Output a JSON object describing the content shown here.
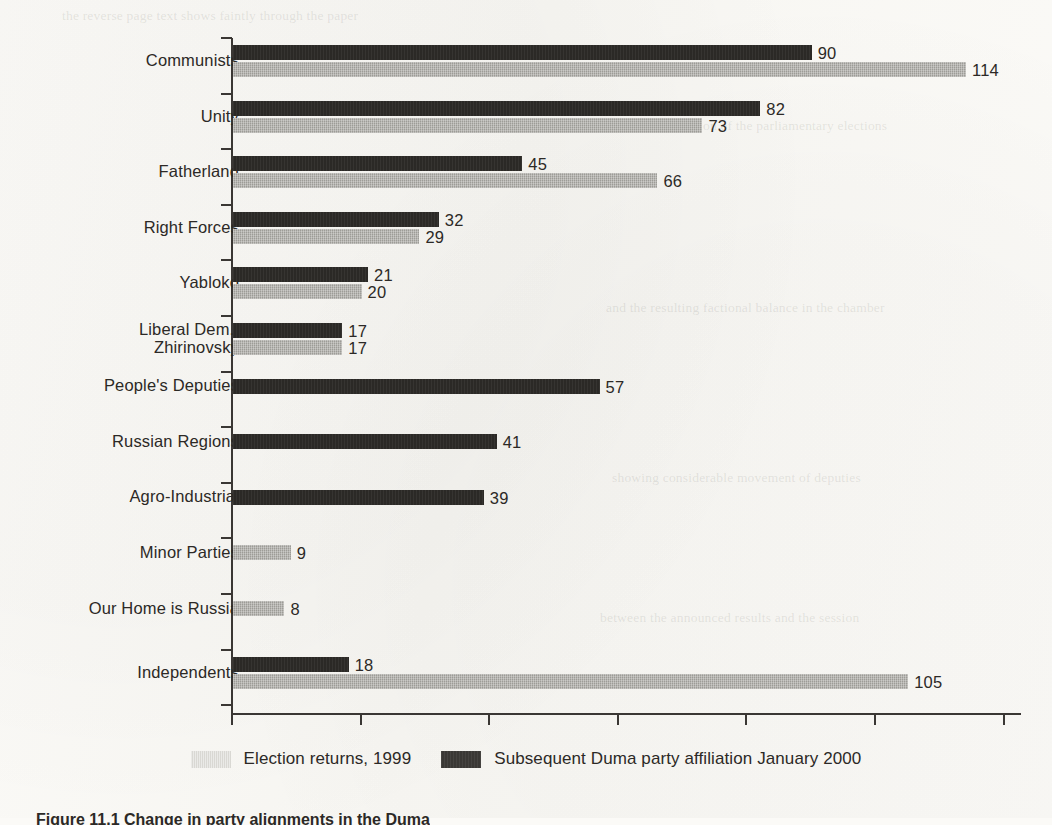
{
  "chart_data": {
    "type": "bar",
    "orientation": "horizontal",
    "title": "",
    "xlabel": "",
    "ylabel": "",
    "xlim": [
      0,
      123
    ],
    "grid": false,
    "axis_ticks_labeled": false,
    "x_tick_count": 7,
    "legend_position": "bottom-center",
    "categories": [
      "Communists",
      "Unity",
      "Fatherland",
      "Right Forces",
      "Yabloko",
      "Liberal Dem./\nZhirinovsky",
      "People's Deputies",
      "Russian Regions",
      "Agro-Industrial",
      "Minor Parties",
      "Our Home is Russia",
      "Independents"
    ],
    "series": [
      {
        "name": "Subsequent Duma party affiliation January 2000",
        "color": "#2b2926",
        "values": [
          90,
          82,
          45,
          32,
          21,
          17,
          57,
          41,
          39,
          null,
          null,
          18
        ]
      },
      {
        "name": "Election returns, 1999",
        "color": "#9d9c97",
        "values": [
          114,
          73,
          66,
          29,
          20,
          17,
          null,
          null,
          null,
          9,
          8,
          105
        ]
      }
    ]
  },
  "legend": {
    "items": [
      {
        "label": "Election returns, 1999",
        "swatch": "light"
      },
      {
        "label": "Subsequent Duma party affiliation January 2000",
        "swatch": "dark"
      }
    ]
  },
  "caption": {
    "text": "Figure 11.1 Change in party alignments in the Duma"
  },
  "colors": {
    "dark_bar": "#2b2926",
    "light_bar": "#9d9c97",
    "legend_light_swatch": "#d9d8d3",
    "axis": "#3a3734",
    "text": "#2c2926",
    "page_background": "#fbfaf7"
  },
  "bleed_through": [
    {
      "text": "the reverse page text shows faintly through the paper",
      "x": 62,
      "y": 8
    },
    {
      "text": "continued discussion of the parliamentary elections",
      "x": 600,
      "y": 118
    },
    {
      "text": "and the resulting factional balance in the chamber",
      "x": 606,
      "y": 300
    },
    {
      "text": "showing considerable movement of deputies",
      "x": 612,
      "y": 470
    },
    {
      "text": "between the announced results and the session",
      "x": 600,
      "y": 610
    }
  ]
}
